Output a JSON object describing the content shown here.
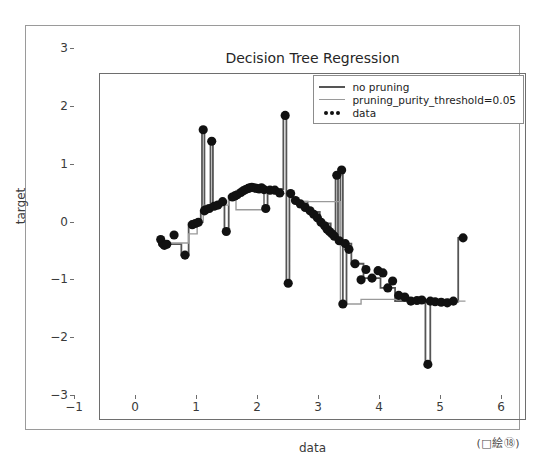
{
  "figure": {
    "caption": "(□絵⑱)"
  },
  "chart_data": {
    "type": "scatter",
    "title": "Decision Tree Regression",
    "xlabel": "data",
    "ylabel": "target",
    "xlim": [
      -1,
      6
    ],
    "ylim": [
      -3,
      3
    ],
    "xticks": [
      -1,
      0,
      1,
      2,
      3,
      4,
      5,
      6
    ],
    "yticks": [
      -3,
      -2,
      -1,
      0,
      1,
      2,
      3
    ],
    "grid": false,
    "legend_position": "upper right",
    "legend": [
      {
        "label": "no pruning",
        "marker": "line",
        "color": "#555555",
        "width": 1.8
      },
      {
        "label": "pruning_purity_threshold=0.05",
        "marker": "line",
        "color": "#9a9a9a",
        "width": 1.4
      },
      {
        "label": "data",
        "marker": "dots",
        "color": "#111111"
      }
    ],
    "scatter": {
      "name": "data",
      "color": "#111111",
      "size": 4.6,
      "points": [
        [
          0.0,
          0.12
        ],
        [
          0.03,
          0.05
        ],
        [
          0.06,
          0.02
        ],
        [
          0.1,
          0.04
        ],
        [
          0.22,
          0.2
        ],
        [
          0.4,
          -0.15
        ],
        [
          0.52,
          0.38
        ],
        [
          0.57,
          0.4
        ],
        [
          0.62,
          0.42
        ],
        [
          0.7,
          2.03
        ],
        [
          0.72,
          0.62
        ],
        [
          0.74,
          0.64
        ],
        [
          0.8,
          0.66
        ],
        [
          0.84,
          1.83
        ],
        [
          0.88,
          0.7
        ],
        [
          0.94,
          0.72
        ],
        [
          1.02,
          0.78
        ],
        [
          1.08,
          0.26
        ],
        [
          1.18,
          0.86
        ],
        [
          1.22,
          0.88
        ],
        [
          1.26,
          0.9
        ],
        [
          1.32,
          0.94
        ],
        [
          1.36,
          0.97
        ],
        [
          1.4,
          0.99
        ],
        [
          1.44,
          1.01
        ],
        [
          1.47,
          1.02
        ],
        [
          1.5,
          1.03
        ],
        [
          1.54,
          1.02
        ],
        [
          1.58,
          1.01
        ],
        [
          1.62,
          1.0
        ],
        [
          1.66,
          1.02
        ],
        [
          1.7,
          0.99
        ],
        [
          1.73,
          0.66
        ],
        [
          1.8,
          0.98
        ],
        [
          1.88,
          0.98
        ],
        [
          1.96,
          0.93
        ],
        [
          2.05,
          2.28
        ],
        [
          2.1,
          -0.64
        ],
        [
          2.14,
          0.92
        ],
        [
          2.22,
          0.8
        ],
        [
          2.3,
          0.74
        ],
        [
          2.38,
          0.68
        ],
        [
          2.46,
          0.62
        ],
        [
          2.52,
          0.56
        ],
        [
          2.58,
          0.5
        ],
        [
          2.64,
          0.42
        ],
        [
          2.7,
          0.36
        ],
        [
          2.74,
          0.3
        ],
        [
          2.78,
          0.26
        ],
        [
          2.82,
          0.22
        ],
        [
          2.86,
          0.18
        ],
        [
          2.9,
          1.24
        ],
        [
          2.94,
          0.1
        ],
        [
          2.98,
          1.33
        ],
        [
          3.0,
          -1.0
        ],
        [
          3.04,
          0.05
        ],
        [
          3.1,
          -0.05
        ],
        [
          3.2,
          -0.3
        ],
        [
          3.3,
          -0.58
        ],
        [
          3.38,
          -0.4
        ],
        [
          3.48,
          -0.55
        ],
        [
          3.58,
          -0.42
        ],
        [
          3.66,
          -0.46
        ],
        [
          3.74,
          -0.72
        ],
        [
          3.82,
          -0.6
        ],
        [
          3.92,
          -0.85
        ],
        [
          4.02,
          -0.88
        ],
        [
          4.12,
          -0.95
        ],
        [
          4.22,
          -0.94
        ],
        [
          4.3,
          -0.93
        ],
        [
          4.4,
          -2.05
        ],
        [
          4.44,
          -0.95
        ],
        [
          4.52,
          -0.96
        ],
        [
          4.62,
          -0.97
        ],
        [
          4.72,
          -0.98
        ],
        [
          4.82,
          -0.95
        ],
        [
          4.98,
          0.15
        ]
      ]
    },
    "series": [
      {
        "name": "no pruning",
        "color": "#555555",
        "width": 1.8,
        "type": "step",
        "points": [
          [
            -0.02,
            0.12
          ],
          [
            0.02,
            0.12
          ],
          [
            0.02,
            0.04
          ],
          [
            0.34,
            0.04
          ],
          [
            0.34,
            -0.15
          ],
          [
            0.46,
            -0.15
          ],
          [
            0.46,
            0.4
          ],
          [
            0.66,
            0.4
          ],
          [
            0.66,
            0.62
          ],
          [
            0.68,
            0.62
          ],
          [
            0.68,
            2.03
          ],
          [
            0.72,
            2.03
          ],
          [
            0.72,
            0.63
          ],
          [
            0.82,
            0.63
          ],
          [
            0.82,
            1.83
          ],
          [
            0.86,
            1.83
          ],
          [
            0.86,
            0.7
          ],
          [
            1.0,
            0.7
          ],
          [
            1.0,
            0.8
          ],
          [
            1.05,
            0.8
          ],
          [
            1.05,
            0.26
          ],
          [
            1.12,
            0.26
          ],
          [
            1.12,
            0.88
          ],
          [
            1.3,
            0.88
          ],
          [
            1.3,
            0.99
          ],
          [
            1.7,
            0.99
          ],
          [
            1.7,
            0.66
          ],
          [
            1.76,
            0.66
          ],
          [
            1.76,
            1.0
          ],
          [
            2.02,
            1.0
          ],
          [
            2.02,
            2.28
          ],
          [
            2.07,
            2.28
          ],
          [
            2.07,
            -0.64
          ],
          [
            2.12,
            -0.64
          ],
          [
            2.12,
            0.92
          ],
          [
            2.18,
            0.92
          ],
          [
            2.18,
            0.78
          ],
          [
            2.42,
            0.78
          ],
          [
            2.42,
            0.6
          ],
          [
            2.62,
            0.6
          ],
          [
            2.62,
            0.4
          ],
          [
            2.8,
            0.4
          ],
          [
            2.8,
            0.2
          ],
          [
            2.88,
            0.2
          ],
          [
            2.88,
            1.24
          ],
          [
            2.92,
            1.24
          ],
          [
            2.92,
            0.12
          ],
          [
            2.96,
            0.12
          ],
          [
            2.96,
            1.33
          ],
          [
            3.0,
            1.33
          ],
          [
            3.0,
            -1.0
          ],
          [
            3.06,
            -1.0
          ],
          [
            3.06,
            0.05
          ],
          [
            3.14,
            0.05
          ],
          [
            3.14,
            -0.3
          ],
          [
            3.34,
            -0.3
          ],
          [
            3.34,
            -0.55
          ],
          [
            3.62,
            -0.55
          ],
          [
            3.62,
            -0.72
          ],
          [
            3.86,
            -0.72
          ],
          [
            3.86,
            -0.95
          ],
          [
            4.36,
            -0.95
          ],
          [
            4.36,
            -2.05
          ],
          [
            4.44,
            -2.05
          ],
          [
            4.44,
            -0.96
          ],
          [
            4.9,
            -0.96
          ],
          [
            4.9,
            0.15
          ],
          [
            5.02,
            0.15
          ]
        ]
      },
      {
        "name": "pruning_purity_threshold=0.05",
        "color": "#9a9a9a",
        "width": 1.4,
        "type": "step",
        "points": [
          [
            -0.02,
            0.06
          ],
          [
            0.46,
            0.06
          ],
          [
            0.46,
            0.22
          ],
          [
            0.6,
            0.22
          ],
          [
            0.6,
            0.42
          ],
          [
            0.7,
            0.42
          ],
          [
            0.7,
            0.72
          ],
          [
            1.12,
            0.72
          ],
          [
            1.12,
            0.88
          ],
          [
            1.24,
            0.88
          ],
          [
            1.24,
            0.64
          ],
          [
            1.7,
            0.64
          ],
          [
            1.7,
            0.92
          ],
          [
            2.16,
            0.92
          ],
          [
            2.16,
            0.78
          ],
          [
            2.96,
            0.78
          ],
          [
            2.96,
            -1.0
          ],
          [
            3.3,
            -1.0
          ],
          [
            3.3,
            -0.92
          ],
          [
            4.82,
            -0.92
          ],
          [
            4.82,
            -0.95
          ],
          [
            5.02,
            -0.95
          ]
        ]
      }
    ]
  }
}
